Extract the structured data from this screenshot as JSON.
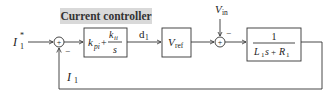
{
  "diagram": {
    "title": "Current controller",
    "input_signal": {
      "base": "I",
      "sub": "1",
      "sup": "*"
    },
    "feedback_signal": {
      "base": "I",
      "sub": "1"
    },
    "sum1": {
      "plus": "+",
      "minus": "−"
    },
    "controller_block": {
      "kp": "k",
      "kp_sub": "pi",
      "plus": "+",
      "ki": "k",
      "ki_sub": "ii",
      "den": "s"
    },
    "duty_signal": {
      "base": "d",
      "sub": "1"
    },
    "vref_block": {
      "base": "V",
      "sub": "ref"
    },
    "disturbance": {
      "base": "V",
      "sub": "in"
    },
    "sum2": {
      "plus": "+",
      "minus": "−"
    },
    "plant_block": {
      "num": "1",
      "den_L": "L",
      "den_L_sub": "1",
      "den_s": "s",
      "den_plus": "+",
      "den_R": "R",
      "den_R_sub": "1"
    }
  }
}
